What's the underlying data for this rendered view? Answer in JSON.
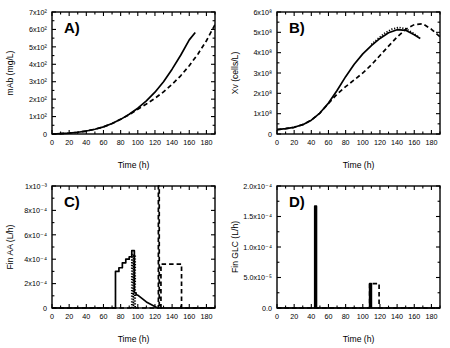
{
  "figure": {
    "panels": [
      "A",
      "B",
      "C",
      "D"
    ],
    "shared_xlabel": "Time (h)"
  },
  "chart_data": [
    {
      "id": "A",
      "type": "line",
      "label": "A)",
      "title": "",
      "xlabel": "Time (h)",
      "ylabel": "mAb (mg/L)",
      "xlim": [
        0,
        190
      ],
      "ylim": [
        0,
        700
      ],
      "xticks": [
        0,
        20,
        40,
        60,
        80,
        100,
        120,
        140,
        160,
        180
      ],
      "yticks": [
        0,
        100,
        200,
        300,
        400,
        500,
        600,
        700
      ],
      "ytick_labels": [
        "0",
        "1x10²",
        "2x10²",
        "3x10²",
        "4x10²",
        "5x10²",
        "6x10²",
        "7x10²"
      ],
      "grid": false,
      "legend": "none",
      "series": [
        {
          "name": "solid",
          "style": "solid",
          "x": [
            0,
            10,
            20,
            30,
            40,
            50,
            60,
            70,
            80,
            90,
            100,
            110,
            120,
            130,
            140,
            150,
            160,
            167
          ],
          "y": [
            0,
            2,
            5,
            10,
            17,
            27,
            41,
            60,
            84,
            113,
            148,
            190,
            240,
            300,
            372,
            452,
            540,
            582
          ]
        },
        {
          "name": "dashed",
          "style": "dashed",
          "x": [
            0,
            10,
            20,
            30,
            40,
            50,
            60,
            70,
            80,
            90,
            100,
            110,
            120,
            130,
            140,
            150,
            160,
            170,
            180,
            190
          ],
          "y": [
            0,
            2,
            5,
            10,
            17,
            27,
            41,
            60,
            84,
            111,
            142,
            172,
            205,
            242,
            285,
            334,
            392,
            458,
            535,
            628
          ]
        }
      ]
    },
    {
      "id": "B",
      "type": "line",
      "label": "B)",
      "title": "",
      "xlabel": "Time (h)",
      "ylabel": "Xv (cells/L)",
      "xlim": [
        0,
        190
      ],
      "ylim": [
        0,
        600000000
      ],
      "xticks": [
        0,
        20,
        40,
        60,
        80,
        100,
        120,
        140,
        160,
        180
      ],
      "yticks": [
        0,
        100000000,
        200000000,
        300000000,
        400000000,
        500000000,
        600000000
      ],
      "ytick_labels": [
        "0",
        "1x10⁸",
        "2x10⁸",
        "3x10⁸",
        "4x10⁸",
        "5x10⁸",
        "6x10⁸"
      ],
      "grid": false,
      "legend": "none",
      "series": [
        {
          "name": "solid",
          "style": "solid",
          "x": [
            0,
            10,
            20,
            30,
            40,
            50,
            60,
            70,
            80,
            90,
            100,
            110,
            120,
            130,
            140,
            150,
            160,
            167
          ],
          "y": [
            22000000,
            26000000,
            33000000,
            46000000,
            68000000,
            103000000,
            152000000,
            214000000,
            282000000,
            343000000,
            394000000,
            435000000,
            470000000,
            498000000,
            513000000,
            510000000,
            488000000,
            470000000
          ]
        },
        {
          "name": "dashed",
          "style": "dashed",
          "x": [
            0,
            10,
            20,
            30,
            40,
            50,
            60,
            70,
            80,
            90,
            100,
            110,
            120,
            130,
            140,
            150,
            160,
            170,
            180,
            190
          ],
          "y": [
            22000000,
            26000000,
            33000000,
            46000000,
            68000000,
            103000000,
            150000000,
            196000000,
            233000000,
            266000000,
            300000000,
            340000000,
            386000000,
            432000000,
            477000000,
            515000000,
            538000000,
            542000000,
            515000000,
            478000000
          ]
        },
        {
          "name": "dotted",
          "style": "dotted",
          "x": [
            110,
            118,
            126,
            134,
            142,
            150,
            158,
            165
          ],
          "y": [
            440000000,
            470000000,
            497000000,
            516000000,
            524000000,
            518000000,
            498000000,
            477000000
          ]
        }
      ]
    },
    {
      "id": "C",
      "type": "line",
      "label": "C)",
      "title": "",
      "xlabel": "Time (h)",
      "ylabel": "Fin AA (L/h)",
      "xlim": [
        0,
        190
      ],
      "ylim": [
        0,
        0.001
      ],
      "xticks": [
        0,
        20,
        40,
        60,
        80,
        100,
        120,
        140,
        160,
        180
      ],
      "yticks": [
        0,
        0.0002,
        0.0004,
        0.0006,
        0.0008,
        0.001
      ],
      "ytick_labels": [
        "0",
        "2x10⁻⁴",
        "4x10⁻⁴",
        "6x10⁻⁴",
        "8x10⁻⁴",
        "1x10⁻³"
      ],
      "grid": false,
      "legend": "none",
      "series": [
        {
          "name": "solid-staircase",
          "style": "solid",
          "x": [
            0,
            74,
            74,
            78,
            78,
            82,
            82,
            86,
            86,
            90,
            90,
            93,
            93,
            96,
            96,
            98,
            98,
            100,
            100,
            110,
            122,
            124,
            190
          ],
          "y": [
            0,
            0,
            0.0003,
            0.0003,
            0.00033,
            0.00033,
            0.00037,
            0.00037,
            0.0004,
            0.0004,
            0.00042,
            0.00042,
            0.00047,
            0.00047,
            0.000125,
            0.000125,
            0.00011,
            0.000105,
            0.000105,
            5e-05,
            5e-06,
            0,
            0
          ]
        },
        {
          "name": "dotted-band",
          "style": "dotted",
          "x": [
            93,
            93,
            95,
            95,
            97,
            97
          ],
          "y": [
            0,
            0.00044,
            0,
            0.00044,
            0,
            0.00044
          ]
        },
        {
          "name": "dashed-pulse",
          "style": "dashed",
          "x": [
            0,
            124,
            124,
            125,
            125,
            127,
            127,
            151,
            151,
            190
          ],
          "y": [
            0,
            0,
            0.001,
            0.001,
            0,
            0,
            0.00036,
            0.00036,
            0,
            0
          ]
        }
      ]
    },
    {
      "id": "D",
      "type": "line",
      "label": "D)",
      "title": "",
      "xlabel": "Time (h)",
      "ylabel": "Fin GLC (L/h)",
      "xlim": [
        0,
        190
      ],
      "ylim": [
        0,
        0.0002
      ],
      "xticks": [
        0,
        20,
        40,
        60,
        80,
        100,
        120,
        140,
        160,
        180
      ],
      "yticks": [
        0,
        5e-05,
        0.0001,
        0.00015,
        0.0002
      ],
      "ytick_labels": [
        "0.0",
        "5.0x10⁻⁵",
        "1.0x10⁻⁴",
        "1.5x10⁻⁴",
        "2.0x10⁻⁴"
      ],
      "grid": false,
      "legend": "none",
      "series": [
        {
          "name": "solid",
          "style": "solid",
          "x": [
            0,
            44,
            44,
            46,
            46,
            108,
            108,
            110,
            110,
            190
          ],
          "y": [
            0,
            0,
            0.000167,
            0.000167,
            0,
            0,
            4e-05,
            4e-05,
            0,
            0
          ]
        },
        {
          "name": "dashed",
          "style": "dashed",
          "x": [
            0,
            108,
            108,
            119,
            119,
            190
          ],
          "y": [
            0,
            0,
            4e-05,
            4e-05,
            0,
            0
          ]
        }
      ]
    }
  ]
}
